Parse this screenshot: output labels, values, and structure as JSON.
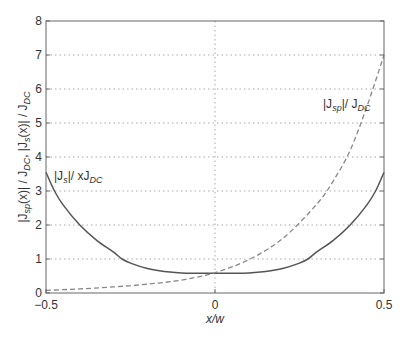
{
  "chart_data": {
    "type": "line",
    "title": "",
    "xlabel": "x/w",
    "ylabel": "|J_sp(x)| / J_DC, |J_s(x)| / J_DC",
    "xlim": [
      -0.5,
      0.5
    ],
    "ylim": [
      0,
      8
    ],
    "xticks": [
      -0.5,
      0,
      0.5
    ],
    "xtick_labels": [
      "−0.5",
      "0",
      "0.5"
    ],
    "yticks": [
      0,
      1,
      2,
      3,
      4,
      5,
      6,
      7,
      8
    ],
    "ytick_labels": [
      "0",
      "1",
      "2",
      "3",
      "4",
      "5",
      "6",
      "7",
      "8"
    ],
    "grid": "dotted horizontal at each y tick; dotted vertical at x=0",
    "legend": "none (inline annotations)",
    "series": [
      {
        "name": "|J_s|/xJ_DC",
        "style": "solid",
        "color": "#555555",
        "x": [
          -0.5,
          -0.475,
          -0.45,
          -0.4,
          -0.35,
          -0.3,
          -0.275,
          -0.25,
          -0.2,
          -0.15,
          -0.1,
          -0.05,
          0,
          0.05,
          0.1,
          0.15,
          0.2,
          0.25,
          0.275,
          0.3,
          0.35,
          0.4,
          0.45,
          0.475,
          0.5
        ],
        "values": [
          3.55,
          3.0,
          2.6,
          2.0,
          1.55,
          1.2,
          1.0,
          0.88,
          0.72,
          0.63,
          0.59,
          0.58,
          0.58,
          0.58,
          0.59,
          0.63,
          0.72,
          0.88,
          1.0,
          1.2,
          1.55,
          2.0,
          2.6,
          3.0,
          3.55
        ]
      },
      {
        "name": "|J_sp|/J_DC",
        "style": "dashed",
        "color": "#888888",
        "x": [
          -0.5,
          -0.4,
          -0.3,
          -0.2,
          -0.1,
          0,
          0.1,
          0.2,
          0.3,
          0.35,
          0.4,
          0.45,
          0.5
        ],
        "values": [
          0.08,
          0.12,
          0.18,
          0.26,
          0.38,
          0.6,
          0.98,
          1.6,
          2.6,
          3.3,
          4.2,
          5.5,
          7.0
        ]
      }
    ],
    "annotations": [
      {
        "text_parts": [
          "|J",
          "s",
          "|/ xJ",
          "DC"
        ],
        "x": -0.48,
        "y": 3.6
      },
      {
        "text_parts": [
          "|J",
          "sp",
          "|/ J",
          "DC"
        ],
        "x": 0.24,
        "y": 5.5
      }
    ]
  },
  "labels": {
    "xlabel": "x/w",
    "ylabel_parts": [
      "|J",
      "sp",
      "(x)| / J",
      "DC",
      ", |J",
      "s",
      "(x)| / J",
      "DC"
    ],
    "ann_js": [
      "|J",
      "s",
      "|/ xJ",
      "DC"
    ],
    "ann_jsp": [
      "|J",
      "sp",
      "|/ J",
      "DC"
    ]
  }
}
